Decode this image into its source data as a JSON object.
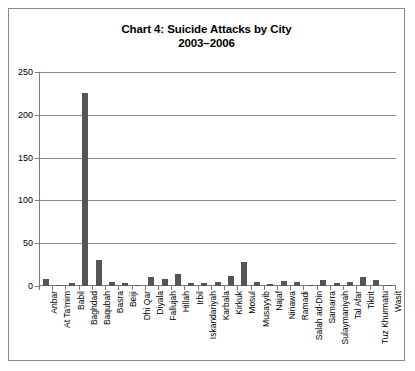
{
  "figure": {
    "title_line1": "Chart 4: Suicide Attacks by City",
    "title_line2": "2003–2006",
    "bar_color": "#555555",
    "grid_color": "#8c8c8c",
    "axis_color": "#7a7a7a",
    "border_color": "#8a8a8a",
    "background": "#ffffff"
  },
  "chart_data": {
    "type": "bar",
    "title": "Chart 4: Suicide Attacks by City 2003–2006",
    "xlabel": "",
    "ylabel": "",
    "ylim": [
      0,
      250
    ],
    "yticks": [
      0,
      50,
      100,
      150,
      200,
      250
    ],
    "ytick_labels": [
      "0",
      "50",
      "100",
      "150",
      "200",
      "250"
    ],
    "grid": true,
    "legend": false,
    "categories": [
      "Anbar",
      "At Ta'mim",
      "Babil",
      "Baghdad",
      "Baqubah",
      "Basra",
      "Beiji",
      "Dhi Qar",
      "Diyala",
      "Fallujah",
      "Hillah",
      "Irbil",
      "Iskandariyah",
      "Karbala",
      "Kirkuk",
      "Mosul",
      "Musayyib",
      "Najaf",
      "Ninawa",
      "Ramadi",
      "Salah ad-Din",
      "Samarra",
      "Sulaymaniyah",
      "Tal Afar",
      "Tikrit",
      "Tuz Khurmatu",
      "Wasit"
    ],
    "values": [
      8,
      1,
      4,
      226,
      30,
      5,
      3,
      1,
      10,
      8,
      14,
      3,
      3,
      5,
      12,
      28,
      5,
      2,
      6,
      5,
      1,
      7,
      3,
      5,
      11,
      7,
      1
    ]
  }
}
